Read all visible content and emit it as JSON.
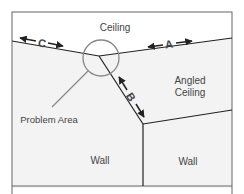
{
  "diagram": {
    "labels": {
      "ceiling": "Ceiling",
      "angled_ceiling_line1": "Angled",
      "angled_ceiling_line2": "Ceiling",
      "problem_area": "Problem Area",
      "wall_left": "Wall",
      "wall_right": "Wall",
      "dimension_a": "A",
      "dimension_b": "B",
      "dimension_c": "C"
    },
    "colors": {
      "frame": "#555555",
      "edge": "#222222",
      "circle": "#888888",
      "ceiling_fill": "#ffffff",
      "wall_fill": "#f3f3f3",
      "text": "#444444"
    }
  }
}
